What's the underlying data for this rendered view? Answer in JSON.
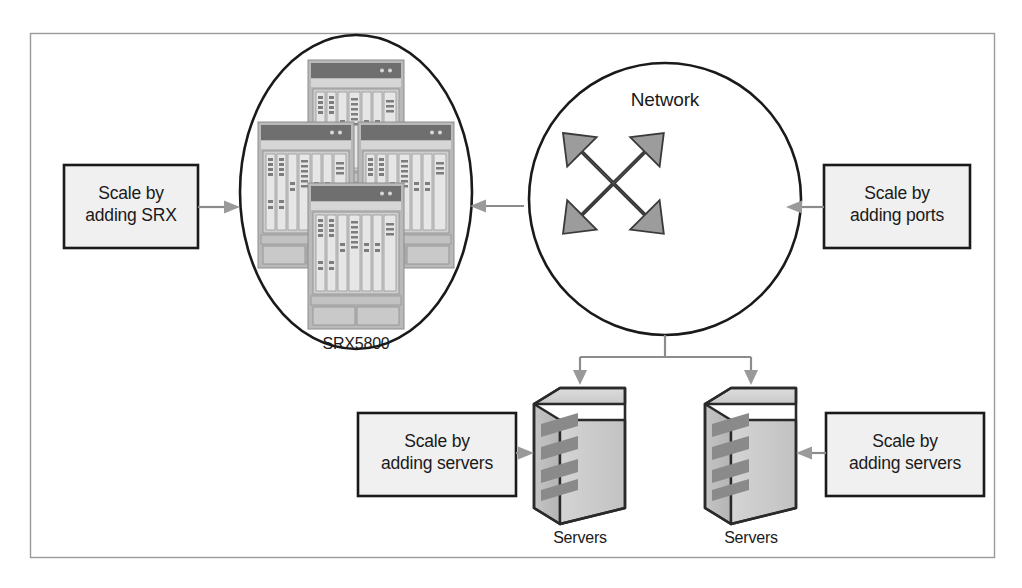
{
  "figure": {
    "type": "network-scaling-diagram",
    "border": {
      "present": true,
      "color": "#9a9a9a"
    },
    "background": "#ffffff"
  },
  "colors": {
    "line": "#8c8c8c",
    "stroke_dark": "#1a1a1a",
    "box_fill": "#f0f0f0",
    "arrow_fill": "#9a9a9a",
    "device_gray": "#a8a8a8",
    "device_light": "#d8d8d8",
    "server_body": "#cfcfcf",
    "server_face": "#bfbfbf",
    "server_slot": "#8f8f8f",
    "text": "#1a1a1a"
  },
  "nodes": {
    "srx_cluster": {
      "name": "SRX5800",
      "label": "SRX5800",
      "shape": "ellipse",
      "device_count": 4,
      "device_type": "chassis"
    },
    "network": {
      "name": "Network",
      "label": "Network",
      "shape": "circle",
      "icon": "four-way-arrow-icon"
    },
    "server_left": {
      "name": "Servers",
      "label": "Servers",
      "shape": "server-box"
    },
    "server_right": {
      "name": "Servers",
      "label": "Servers",
      "shape": "server-box"
    }
  },
  "callouts": [
    {
      "id": "scale-srx",
      "line1": "Scale by",
      "line2": "adding SRX",
      "text": "Scale by\nadding SRX",
      "points_to": "srx_cluster",
      "arrow_direction": "right"
    },
    {
      "id": "scale-ports",
      "line1": "Scale by",
      "line2": "adding ports",
      "text": "Scale by\nadding ports",
      "points_to": "network",
      "arrow_direction": "left"
    },
    {
      "id": "scale-servers-left",
      "line1": "Scale by",
      "line2": "adding servers",
      "text": "Scale by\nadding servers",
      "points_to": "server_left",
      "arrow_direction": "right"
    },
    {
      "id": "scale-servers-right",
      "line1": "Scale by",
      "line2": "adding servers",
      "text": "Scale by\nadding servers",
      "points_to": "server_right",
      "arrow_direction": "left"
    }
  ],
  "connections": [
    {
      "from": "network",
      "to": "srx_cluster",
      "direction": "left",
      "style": "arrow"
    },
    {
      "from": "network",
      "to": "server_left",
      "direction": "down",
      "style": "arrow"
    },
    {
      "from": "network",
      "to": "server_right",
      "direction": "down",
      "style": "arrow"
    }
  ]
}
